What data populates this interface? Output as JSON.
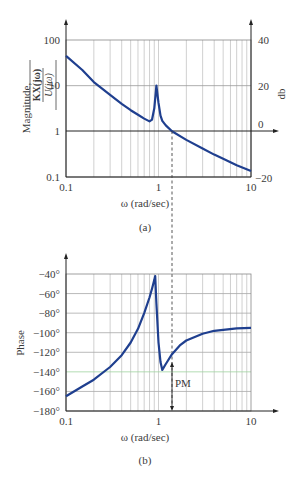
{
  "chart_data": [
    {
      "type": "line",
      "panel": "(a)",
      "title": "",
      "xlabel": "ω (rad/sec)",
      "ylabel": "Magnitude, |KX(jω) / U(jω)|",
      "ylabel_right": "db",
      "xscale": "log",
      "yscale": "log",
      "xlim": [
        0.1,
        10
      ],
      "ylim": [
        0.1,
        100
      ],
      "x_ticks": [
        "0.1",
        "1",
        "10"
      ],
      "y_ticks": [
        "0.1",
        "1",
        "10",
        "100"
      ],
      "y_ticks_right": [
        "−20",
        "0",
        "20",
        "40"
      ],
      "grid": true,
      "series": [
        {
          "name": "Magnitude",
          "color": "#1f3f8f",
          "x": [
            0.1,
            0.15,
            0.2,
            0.3,
            0.4,
            0.5,
            0.6,
            0.7,
            0.8,
            0.85,
            0.9,
            0.95,
            1.0,
            1.05,
            1.1,
            1.2,
            1.4,
            2,
            3,
            4,
            5,
            7,
            10
          ],
          "y": [
            45,
            22,
            12,
            6.3,
            4.0,
            2.9,
            2.3,
            1.9,
            1.65,
            1.8,
            3.2,
            10,
            4.2,
            2.2,
            1.7,
            1.35,
            1.0,
            0.65,
            0.42,
            0.31,
            0.25,
            0.18,
            0.135
          ]
        }
      ],
      "annotations": [
        {
          "type": "dashed-vline",
          "x": 1.4,
          "label": "crossover"
        }
      ]
    },
    {
      "type": "line",
      "panel": "(b)",
      "title": "",
      "xlabel": "ω (rad/sec)",
      "ylabel": "Phase",
      "xscale": "log",
      "xlim": [
        0.1,
        10
      ],
      "ylim": [
        -180,
        -40
      ],
      "x_ticks": [
        "0.1",
        "1",
        "10"
      ],
      "y_ticks": [
        "−180°",
        "−160°",
        "−140°",
        "−120°",
        "−100°",
        "−80°",
        "−60°",
        "−40°"
      ],
      "grid": true,
      "series": [
        {
          "name": "Phase",
          "color": "#1f3f8f",
          "x": [
            0.1,
            0.15,
            0.2,
            0.3,
            0.4,
            0.5,
            0.6,
            0.7,
            0.8,
            0.85,
            0.9,
            0.92,
            0.95,
            1.0,
            1.05,
            1.1,
            1.2,
            1.4,
            1.7,
            2,
            3,
            4,
            5,
            7,
            10
          ],
          "y": [
            -165,
            -155,
            -148,
            -135,
            -123,
            -110,
            -96,
            -80,
            -64,
            -55,
            -46,
            -42,
            -70,
            -110,
            -130,
            -138,
            -132,
            -122,
            -113,
            -108,
            -101,
            -98,
            -97,
            -95.5,
            -95
          ]
        }
      ],
      "annotations": [
        {
          "type": "arrow",
          "x": 1.4,
          "from": -125,
          "to": -180,
          "label": "PM"
        },
        {
          "type": "highlight-gridline",
          "y": -140,
          "color": "#8fcf8f"
        }
      ]
    }
  ],
  "labels": {
    "top": {
      "y_ticks": [
        "100",
        "10",
        "1",
        "0.1"
      ],
      "y_ticks_right": [
        "40",
        "20",
        "0",
        "−20"
      ],
      "x_ticks": [
        "0.1",
        "1",
        "10"
      ],
      "xlabel": "ω (rad/sec)",
      "ylabel_word": "Magnitude,",
      "ylabel_num": "KX(jω)",
      "ylabel_den": "U(jω)",
      "ylabel_right": "db",
      "caption": "(a)"
    },
    "bottom": {
      "y_ticks": [
        "−40°",
        "−60°",
        "−80°",
        "−100°",
        "−120°",
        "−140°",
        "−160°",
        "−180°"
      ],
      "x_ticks": [
        "0.1",
        "1",
        "10"
      ],
      "xlabel": "ω (rad/sec)",
      "ylabel": "Phase",
      "pm_label": "PM",
      "caption": "(b)"
    }
  }
}
